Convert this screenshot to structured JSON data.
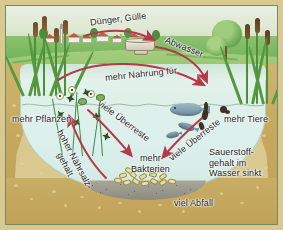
{
  "diagram": {
    "labels": {
      "fertilizer": "Dünger, Gülle",
      "wastewater": "Abwasser",
      "more_food": "mehr Nahrung für",
      "more_plants": "mehr Pflanzen",
      "more_animals": "mehr Tiere",
      "remains_left": "viele Überreste",
      "remains_right": "viele Überreste",
      "nutrient_line1": "hoher Nährsalz-",
      "nutrient_line2": "gehalt",
      "bacteria_line1": "mehr",
      "bacteria_line2": "Bakterien",
      "oxygen_line1": "Sauerstoff-",
      "oxygen_line2": "gehalt im",
      "oxygen_line3": "Wasser sinkt",
      "waste": "viel Abfall"
    },
    "colors": {
      "arrow": "#b33a4a",
      "arrow_dark": "#9e2f40",
      "water": "#dff0e9",
      "bank_soil": "#c6a95e",
      "meadow": "#77b85e",
      "sky": "#e4ecdc",
      "sediment": "#8d8b80",
      "debris": "#eadf9d",
      "frame_border": "#6f8b6a",
      "paper": "#d9c98f",
      "text": "#1b1b1b"
    },
    "scene": {
      "sky_region": "distant hills and sky",
      "village": "farm village with red roofed houses and church tower",
      "pipe": "drainage outlet pipe discharging into pond",
      "left_bank_plants": "cattails and reeds",
      "right_bank_plants": "trees and bulrushes",
      "underwater_left": "water plants with white flowers and lily pads",
      "underwater_algae": "dark algae flakes",
      "fauna": "fish, tadpoles and water insects",
      "lake_bed": "grey sediment with debris heap"
    }
  }
}
